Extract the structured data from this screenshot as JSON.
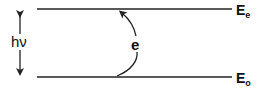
{
  "diagram": {
    "type": "energy-level-diagram",
    "levels": [
      {
        "id": "excited",
        "label": "E",
        "subscript": "e",
        "y": 9
      },
      {
        "id": "ground",
        "label": "E",
        "subscript": "o",
        "y": 77
      }
    ],
    "photon_label": "hν",
    "transition_label": "e",
    "colors": {
      "line": "#222222",
      "text": "#111111",
      "background": "#ffffff"
    }
  }
}
